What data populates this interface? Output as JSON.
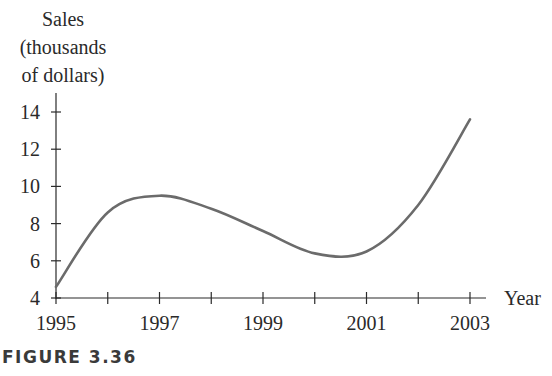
{
  "chart_data": {
    "type": "line",
    "title": "",
    "ylabel_lines": [
      "Sales",
      "(thousands",
      "of dollars)"
    ],
    "ylabel": "Sales (thousands of dollars)",
    "xlabel": "Year",
    "x_tick_labels": [
      "1995",
      "1997",
      "1999",
      "2001",
      "2003"
    ],
    "x_ticks": [
      1995,
      1996,
      1997,
      1998,
      1999,
      2000,
      2001,
      2002,
      2003
    ],
    "y_tick_labels": [
      "4",
      "6",
      "8",
      "10",
      "12",
      "14"
    ],
    "y_ticks": [
      4,
      6,
      8,
      10,
      12,
      14
    ],
    "xlim": [
      1995,
      2003
    ],
    "ylim": [
      4,
      14
    ],
    "grid": false,
    "legend": null,
    "series": [
      {
        "name": "Sales",
        "x": [
          1995,
          1996,
          1997,
          1998,
          1999,
          2000,
          2001,
          2002,
          2003
        ],
        "values": [
          4.6,
          8.6,
          9.5,
          8.8,
          7.6,
          6.4,
          6.5,
          9.0,
          13.6
        ]
      }
    ],
    "annotations": {
      "local_max": {
        "x": 1997.1,
        "y": 9.5
      },
      "local_min": {
        "x": 2000.6,
        "y": 6.2
      }
    }
  },
  "caption": "FIGURE 3.36",
  "colors": {
    "curve": "#6b6b6b",
    "axis": "#2a2a2a",
    "text": "#2a2a2a"
  }
}
